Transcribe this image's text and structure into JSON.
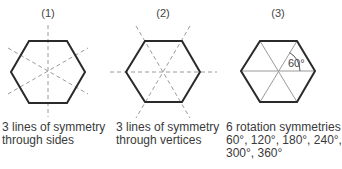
{
  "figure": {
    "panels": [
      {
        "label": "(1)",
        "caption_lines": [
          "3 lines of symmetry",
          "through sides"
        ],
        "symmetry_type": "reflection",
        "line_count": 3,
        "line_style": "dashed",
        "lines_through": "sides"
      },
      {
        "label": "(2)",
        "caption_lines": [
          "3 lines of symmetry",
          "through vertices"
        ],
        "symmetry_type": "reflection",
        "line_count": 3,
        "line_style": "dashed",
        "lines_through": "vertices"
      },
      {
        "label": "(3)",
        "caption_lines": [
          "6 rotation symmetries",
          "60°, 120°, 180°, 240°,",
          "300°, 360°"
        ],
        "symmetry_type": "rotation",
        "angle_label": "60°",
        "line_style": "solid"
      }
    ],
    "colors": {
      "hexagon_stroke": "#2a2a2a",
      "symmetry_line": "#9a9a9a",
      "text": "#3a3a3a"
    }
  }
}
